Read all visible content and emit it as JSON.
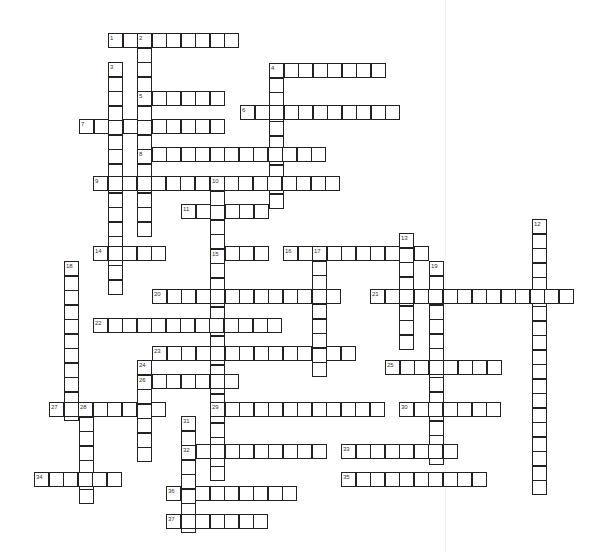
{
  "puzzle": {
    "type": "crossword",
    "cell_size": 14.5,
    "words": [
      {
        "number": "1",
        "dir": "across",
        "x": 108,
        "y": 33,
        "length": 9
      },
      {
        "number": "2",
        "dir": "down",
        "x": 137,
        "y": 33,
        "length": 14
      },
      {
        "number": "3",
        "dir": "down",
        "x": 108,
        "y": 62,
        "length": 16
      },
      {
        "number": "4",
        "dir": "across",
        "x": 269,
        "y": 63,
        "length": 8
      },
      {
        "number": "4",
        "dir": "down",
        "x": 269,
        "y": 63,
        "length": 10
      },
      {
        "number": "5",
        "dir": "across",
        "x": 137,
        "y": 91,
        "length": 6
      },
      {
        "number": "6",
        "dir": "across",
        "x": 240,
        "y": 105,
        "length": 11
      },
      {
        "number": "7",
        "dir": "across",
        "x": 79,
        "y": 119,
        "length": 10
      },
      {
        "number": "8",
        "dir": "across",
        "x": 137,
        "y": 147,
        "length": 13
      },
      {
        "number": "9",
        "dir": "across",
        "x": 93,
        "y": 176,
        "length": 17
      },
      {
        "number": "10",
        "dir": "down",
        "x": 210,
        "y": 176,
        "length": 21
      },
      {
        "number": "11",
        "dir": "across",
        "x": 181,
        "y": 204,
        "length": 6
      },
      {
        "number": "12",
        "dir": "down",
        "x": 532,
        "y": 219,
        "length": 19
      },
      {
        "number": "13",
        "dir": "down",
        "x": 399,
        "y": 233,
        "length": 8
      },
      {
        "number": "14",
        "dir": "across",
        "x": 93,
        "y": 246,
        "length": 5
      },
      {
        "number": "15",
        "dir": "across",
        "x": 210,
        "y": 246,
        "length": 4
      },
      {
        "number": "16",
        "dir": "across",
        "x": 283,
        "y": 246,
        "length": 10
      },
      {
        "number": "17",
        "dir": "down",
        "x": 312,
        "y": 246,
        "length": 9
      },
      {
        "number": "18",
        "dir": "down",
        "x": 64,
        "y": 261,
        "length": 11
      },
      {
        "number": "19",
        "dir": "down",
        "x": 429,
        "y": 261,
        "length": 14
      },
      {
        "number": "20",
        "dir": "across",
        "x": 152,
        "y": 289,
        "length": 13
      },
      {
        "number": "21",
        "dir": "across",
        "x": 370,
        "y": 289,
        "length": 14
      },
      {
        "number": "22",
        "dir": "across",
        "x": 93,
        "y": 318,
        "length": 13
      },
      {
        "number": "23",
        "dir": "across",
        "x": 152,
        "y": 346,
        "length": 14
      },
      {
        "number": "24",
        "dir": "down",
        "x": 137,
        "y": 360,
        "length": 7
      },
      {
        "number": "25",
        "dir": "across",
        "x": 385,
        "y": 360,
        "length": 8
      },
      {
        "number": "26",
        "dir": "across",
        "x": 137,
        "y": 374,
        "length": 7
      },
      {
        "number": "27",
        "dir": "across",
        "x": 49,
        "y": 402,
        "length": 8
      },
      {
        "number": "28",
        "dir": "down",
        "x": 79,
        "y": 402,
        "length": 7
      },
      {
        "number": "29",
        "dir": "across",
        "x": 210,
        "y": 402,
        "length": 12
      },
      {
        "number": "30",
        "dir": "across",
        "x": 399,
        "y": 402,
        "length": 7
      },
      {
        "number": "31",
        "dir": "down",
        "x": 181,
        "y": 416,
        "length": 8
      },
      {
        "number": "32",
        "dir": "across",
        "x": 181,
        "y": 444,
        "length": 10
      },
      {
        "number": "33",
        "dir": "across",
        "x": 341,
        "y": 444,
        "length": 8
      },
      {
        "number": "34",
        "dir": "across",
        "x": 34,
        "y": 472,
        "length": 6
      },
      {
        "number": "35",
        "dir": "across",
        "x": 341,
        "y": 472,
        "length": 10
      },
      {
        "number": "36",
        "dir": "across",
        "x": 166,
        "y": 486,
        "length": 9
      },
      {
        "number": "37",
        "dir": "across",
        "x": 166,
        "y": 514,
        "length": 7
      }
    ],
    "colors": {
      "cell_border": "#222222",
      "cell_fill": "#ffffff",
      "number_text": "#333333"
    }
  }
}
